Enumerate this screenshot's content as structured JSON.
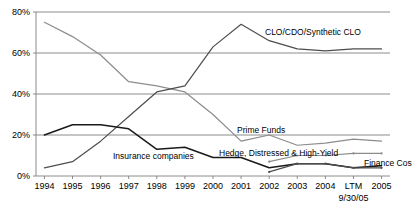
{
  "chart_data": {
    "type": "line",
    "title": "",
    "xlabel": "",
    "ylabel": "",
    "grid": true,
    "legend_position": "inline-annotations",
    "ylim": [
      0,
      80
    ],
    "ytick_labels": [
      "0%",
      "20%",
      "40%",
      "60%",
      "80%"
    ],
    "ytick_values": [
      0,
      20,
      40,
      60,
      80
    ],
    "categories": [
      "1994",
      "1995",
      "1996",
      "1997",
      "1998",
      "1999",
      "2000",
      "2001",
      "2002",
      "2003",
      "2004",
      "LTM",
      "2005"
    ],
    "xtick_sublabels": [
      "",
      "",
      "",
      "",
      "",
      "",
      "",
      "",
      "",
      "",
      "",
      "9/30/05",
      ""
    ],
    "series": [
      {
        "name": "Prime Funds",
        "color": "#8c8c8c",
        "label_text": "Prime Funds",
        "values": [
          75,
          68,
          59,
          46,
          44,
          41,
          30,
          17,
          20,
          15,
          16,
          18,
          17
        ]
      },
      {
        "name": "CLO/CDO/Synthetic CLO",
        "color": "#4d4d4d",
        "label_text": "CLO/CDO/Synthetic CLO",
        "values": [
          4,
          7,
          17,
          29,
          41,
          44,
          63,
          74,
          66,
          62,
          61,
          62,
          62
        ]
      },
      {
        "name": "Insurance companies",
        "color": "#1a1a1a",
        "label_text": "Insurance companies",
        "values": [
          20,
          25,
          25,
          23,
          13,
          14,
          9,
          9,
          4,
          6,
          6,
          4,
          5
        ]
      },
      {
        "name": "Hedge, Distressed & High-Yield",
        "color": "#8c8c8c",
        "label_text": "Hedge, Distressed & High-Yield",
        "values": [
          null,
          null,
          null,
          null,
          null,
          null,
          null,
          null,
          7,
          10,
          10,
          11,
          11
        ]
      },
      {
        "name": "Finance Cos",
        "color": "#4d4d4d",
        "label_text": "Finance Cos",
        "values": [
          null,
          null,
          null,
          null,
          null,
          null,
          null,
          null,
          2,
          6,
          6,
          4,
          4
        ]
      }
    ],
    "annotations": [
      {
        "name": "clo-label",
        "text": "CLO/CDO/Synthetic CLO",
        "x": 265,
        "y": 35
      },
      {
        "name": "prime-funds-label",
        "text": "Prime Funds",
        "x": 237,
        "y": 133
      },
      {
        "name": "hedge-label",
        "text": "Hedge, Distressed & High-Yield",
        "x": 219,
        "y": 156
      },
      {
        "name": "insurance-label",
        "text": "Insurance companies",
        "x": 113,
        "y": 159
      },
      {
        "name": "finance-cos-label",
        "text": "Finance Cos",
        "x": 364,
        "y": 166
      }
    ]
  }
}
